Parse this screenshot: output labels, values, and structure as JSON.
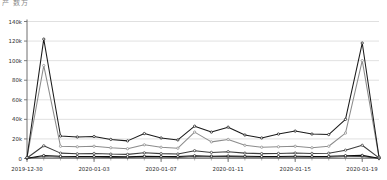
{
  "header": {
    "title": "产 数方"
  },
  "axes": {
    "y_ticks": [
      "0",
      "20k",
      "40k",
      "60k",
      "80k",
      "100k",
      "120k",
      "140k"
    ],
    "x_ticks": [
      "2019-12-30",
      "2020-01-03",
      "2020-01-07",
      "2020-01-11",
      "2020-01-15",
      "2020-01-19"
    ]
  },
  "chart_data": {
    "type": "line",
    "title": "",
    "xlabel": "",
    "ylabel": "",
    "grid": true,
    "legend": "none",
    "ylim": [
      0,
      140000
    ],
    "ytick_values": [
      0,
      20000,
      40000,
      60000,
      80000,
      100000,
      120000,
      140000
    ],
    "ytick_labels": [
      "0",
      "20k",
      "40k",
      "60k",
      "80k",
      "100k",
      "120k",
      "140k"
    ],
    "x": [
      "2019-12-30",
      "2019-12-31",
      "2020-01-01",
      "2020-01-02",
      "2020-01-03",
      "2020-01-04",
      "2020-01-05",
      "2020-01-06",
      "2020-01-07",
      "2020-01-08",
      "2020-01-09",
      "2020-01-10",
      "2020-01-11",
      "2020-01-12",
      "2020-01-13",
      "2020-01-14",
      "2020-01-15",
      "2020-01-16",
      "2020-01-17",
      "2020-01-18",
      "2020-01-19",
      "2020-01-20"
    ],
    "xtick_labels": [
      "2019-12-30",
      "2020-01-03",
      "2020-01-07",
      "2020-01-11",
      "2020-01-15",
      "2020-01-19"
    ],
    "xtick_indices": [
      0,
      4,
      8,
      12,
      16,
      20
    ],
    "series": [
      {
        "name": "series-1",
        "color": "#1a1a1a",
        "values": [
          1000,
          122000,
          23000,
          22000,
          22500,
          19500,
          18000,
          25500,
          21000,
          19000,
          33000,
          27000,
          32000,
          24000,
          21000,
          25000,
          28000,
          25000,
          24500,
          40000,
          118000,
          1500
        ]
      },
      {
        "name": "series-2",
        "color": "#8c8c8c",
        "values": [
          800,
          95000,
          12500,
          12000,
          12500,
          11000,
          10000,
          14000,
          11500,
          10500,
          27000,
          17000,
          19500,
          13500,
          11500,
          12000,
          12500,
          11000,
          12500,
          26000,
          100000,
          1200
        ]
      },
      {
        "name": "series-3",
        "color": "#3d3d3d",
        "values": [
          500,
          13000,
          5500,
          4800,
          5200,
          4500,
          4200,
          5800,
          5000,
          4600,
          8000,
          6200,
          7000,
          5500,
          5000,
          5200,
          5600,
          5200,
          5400,
          8500,
          13500,
          600
        ]
      },
      {
        "name": "series-4",
        "color": "#0d0d0d",
        "values": [
          300,
          3000,
          2200,
          2000,
          2100,
          1900,
          1800,
          2300,
          2100,
          1950,
          2800,
          2400,
          2600,
          2200,
          2050,
          2150,
          2250,
          2150,
          2200,
          2900,
          3200,
          350
        ]
      },
      {
        "name": "series-5",
        "color": "#555555",
        "values": [
          200,
          1800,
          1300,
          1200,
          1250,
          1150,
          1100,
          1400,
          1250,
          1150,
          1700,
          1450,
          1550,
          1300,
          1200,
          1250,
          1300,
          1250,
          1300,
          1750,
          1900,
          220
        ]
      }
    ]
  }
}
